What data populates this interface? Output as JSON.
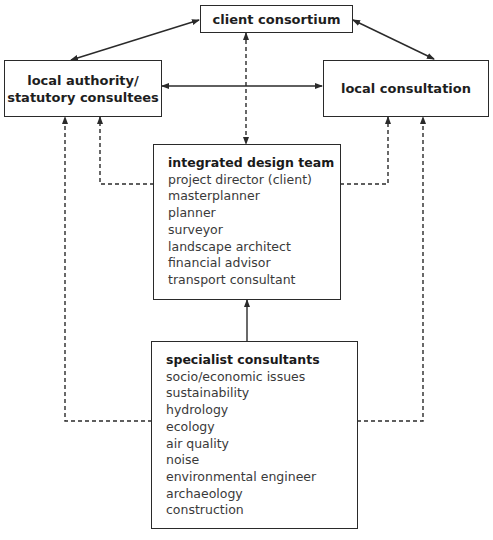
{
  "diagram": {
    "nodes": {
      "client_consortium": {
        "label": "client consortium"
      },
      "local_authority": {
        "label_line1": "local authority/",
        "label_line2": "statutory consultees"
      },
      "local_consultation": {
        "label": "local consultation"
      },
      "integrated_design_team": {
        "title": "integrated design team",
        "members": [
          "project director (client)",
          "masterplanner",
          "planner",
          "surveyor",
          "landscape architect",
          "financial advisor",
          "transport consultant"
        ]
      },
      "specialist_consultants": {
        "title": "specialist consultants",
        "members": [
          "socio/economic issues",
          "sustainability",
          "hydrology",
          "ecology",
          "air quality",
          "noise",
          "environmental engineer",
          "archaeology",
          "construction"
        ]
      }
    },
    "edges": [
      {
        "from": "client_consortium",
        "to": "local_authority",
        "style": "solid",
        "arrows": "both"
      },
      {
        "from": "client_consortium",
        "to": "local_consultation",
        "style": "solid",
        "arrows": "both"
      },
      {
        "from": "local_authority",
        "to": "local_consultation",
        "style": "solid",
        "arrows": "both"
      },
      {
        "from": "client_consortium",
        "to": "integrated_design_team",
        "style": "dashed",
        "arrows": "both"
      },
      {
        "from": "integrated_design_team",
        "to": "local_authority",
        "style": "dashed",
        "arrows": "to"
      },
      {
        "from": "integrated_design_team",
        "to": "local_consultation",
        "style": "dashed",
        "arrows": "to"
      },
      {
        "from": "specialist_consultants",
        "to": "integrated_design_team",
        "style": "solid",
        "arrows": "to"
      },
      {
        "from": "specialist_consultants",
        "to": "local_authority",
        "style": "dashed",
        "arrows": "to"
      },
      {
        "from": "specialist_consultants",
        "to": "local_consultation",
        "style": "dashed",
        "arrows": "to"
      }
    ]
  },
  "colors": {
    "line": "#2a2a2a",
    "text": "#1a1a1a",
    "list_text": "#3a3a3a",
    "background": "#ffffff"
  }
}
